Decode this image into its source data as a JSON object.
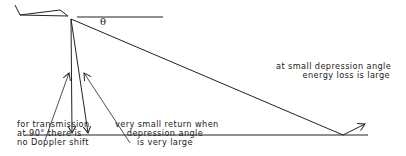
{
  "diagram": {
    "symbol": "θ",
    "labels": {
      "doppler": [
        "for transmission",
        "at 90° there is",
        "no Doppler shift"
      ],
      "small_return": [
        "very small return when",
        "depression angle",
        "is very large"
      ],
      "energy_loss": [
        "at small depression angle",
        "energy loss is large"
      ]
    },
    "colors": {
      "line": "#222222",
      "background": "#ffffff"
    }
  }
}
